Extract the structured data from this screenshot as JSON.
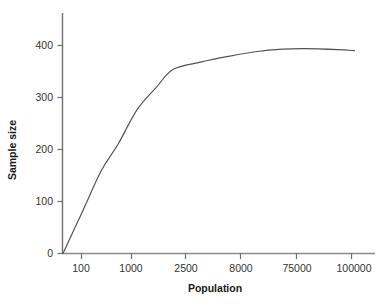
{
  "chart_data": {
    "type": "line",
    "title": "",
    "xlabel": "Population",
    "ylabel": "Sample size",
    "grid": false,
    "legend": null,
    "x_axis_scale": "ordinal",
    "categories": [
      "100",
      "1000",
      "2500",
      "8000",
      "75000",
      "100000"
    ],
    "xtick_labels": [
      "100",
      "1000",
      "2500",
      "8000",
      "75000",
      "100000"
    ],
    "ytick_labels": [
      "0",
      "100",
      "200",
      "300",
      "400"
    ],
    "ylim": [
      0,
      440
    ],
    "yticks": [
      0,
      100,
      200,
      300,
      400
    ],
    "series": [
      {
        "name": "Sample size vs Population",
        "color": "#555555",
        "points": [
          {
            "x_label": "",
            "x_pos": 0.0,
            "y": 0
          },
          {
            "x_label": "100",
            "x_pos": 0.35,
            "y": 80
          },
          {
            "x_label": "",
            "x_pos": 0.7,
            "y": 160
          },
          {
            "x_label": "",
            "x_pos": 1.0,
            "y": 210
          },
          {
            "x_label": "1000",
            "x_pos": 1.35,
            "y": 277
          },
          {
            "x_label": "",
            "x_pos": 1.7,
            "y": 320
          },
          {
            "x_label": "2500",
            "x_pos": 2.0,
            "y": 354
          },
          {
            "x_label": "",
            "x_pos": 2.5,
            "y": 368
          },
          {
            "x_label": "8000",
            "x_pos": 3.0,
            "y": 379
          },
          {
            "x_label": "",
            "x_pos": 3.5,
            "y": 388
          },
          {
            "x_label": "75000",
            "x_pos": 4.0,
            "y": 393
          },
          {
            "x_label": "",
            "x_pos": 4.4,
            "y": 394
          },
          {
            "x_label": "100000",
            "x_pos": 5.0,
            "y": 392
          },
          {
            "x_label": "",
            "x_pos": 5.3,
            "y": 390
          }
        ]
      }
    ],
    "annotations": []
  },
  "axis": {
    "y_title": "Sample size",
    "x_title": "Population",
    "y_tick_0": "0",
    "y_tick_1": "100",
    "y_tick_2": "200",
    "y_tick_3": "300",
    "y_tick_4": "400",
    "x_tick_0": "100",
    "x_tick_1": "1000",
    "x_tick_2": "2500",
    "x_tick_3": "8000",
    "x_tick_4": "75000",
    "x_tick_5": "100000"
  },
  "colors": {
    "axis": "#6e6e6e",
    "curve": "#555555",
    "tick_text": "#333333",
    "title_text": "#1a1a1a",
    "background": "#ffffff"
  }
}
